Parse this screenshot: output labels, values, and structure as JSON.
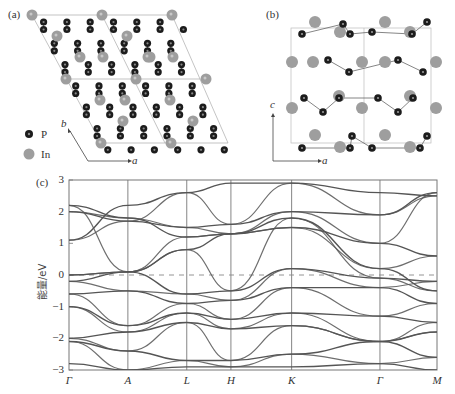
{
  "panels": {
    "a": {
      "label": "(a)",
      "axis_b": "b",
      "axis_a": "a"
    },
    "b": {
      "label": "(b)",
      "axis_c": "c",
      "axis_a": "a"
    },
    "c": {
      "label": "(c)"
    }
  },
  "legend": [
    {
      "symbol": "P",
      "label": "P",
      "color": "#1a1a1a"
    },
    {
      "symbol": "In",
      "label": "In",
      "color": "#9a9a9a"
    }
  ],
  "colors": {
    "band": "#555555",
    "frame": "#777777",
    "in_atom": "#9e9e9e",
    "p_atom": "#1c1c1c",
    "bond": "#666666"
  },
  "chart_data": {
    "type": "line",
    "title": "",
    "xlabel": "",
    "ylabel": "能量/eV",
    "ylim": [
      -3,
      3
    ],
    "yticks": [
      "3",
      "2",
      "1",
      "0",
      "-1",
      "-2",
      "-3"
    ],
    "kpoints": [
      "Γ",
      "A",
      "L",
      "H",
      "K",
      "Γ",
      "M"
    ],
    "kpoint_fractions": [
      0.0,
      0.16,
      0.32,
      0.44,
      0.605,
      0.845,
      1.0
    ],
    "fermi_level": 0,
    "fermi_style": "dashed",
    "series": [
      {
        "name": "band-1",
        "values": [
          1.1,
          2.2,
          2.6,
          2.9,
          2.9,
          2.6,
          2.5
        ]
      },
      {
        "name": "band-2",
        "values": [
          2.0,
          1.7,
          1.5,
          1.6,
          2.0,
          1.9,
          2.6
        ]
      },
      {
        "name": "band-3",
        "values": [
          2.2,
          1.8,
          1.2,
          1.3,
          1.5,
          1.0,
          0.6
        ]
      },
      {
        "name": "band-4",
        "values": [
          0.0,
          0.1,
          0.8,
          1.3,
          1.8,
          0.2,
          -0.5
        ]
      },
      {
        "name": "band-5",
        "values": [
          -0.2,
          0.1,
          -0.6,
          -0.5,
          0.2,
          -0.1,
          -0.2
        ]
      },
      {
        "name": "band-6",
        "values": [
          -0.6,
          -0.5,
          -0.9,
          -0.8,
          -0.4,
          -0.4,
          -0.9
        ]
      },
      {
        "name": "band-7",
        "values": [
          -1.0,
          -1.6,
          -1.2,
          -1.4,
          -1.2,
          -1.3,
          -1.5
        ]
      },
      {
        "name": "band-8",
        "values": [
          -2.0,
          -1.8,
          -1.5,
          -1.7,
          -1.6,
          -2.1,
          -1.8
        ]
      },
      {
        "name": "band-9",
        "values": [
          -2.1,
          -2.4,
          -2.7,
          -2.7,
          -2.5,
          -2.1,
          -2.6
        ]
      },
      {
        "name": "band-10",
        "values": [
          -2.8,
          -3.0,
          -2.9,
          -2.9,
          -2.9,
          -2.8,
          -3.0
        ]
      }
    ]
  }
}
